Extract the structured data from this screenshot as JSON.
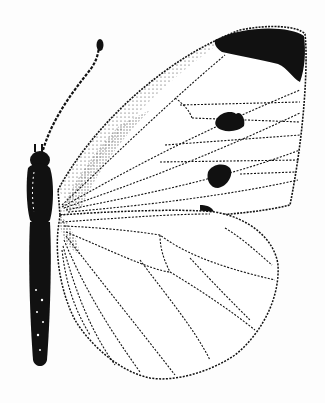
{
  "image": {
    "subject": "butterfly illustration",
    "style": "black-and-white stippled line drawing",
    "colors": {
      "background": "#fdfdfd",
      "ink": "#111111"
    },
    "features": [
      "antenna",
      "head",
      "thorax",
      "abdomen",
      "forewing",
      "hindwing",
      "forewing-apex-patch",
      "forewing-spot-upper",
      "forewing-spot-lower",
      "forewing-costal-mark"
    ]
  }
}
